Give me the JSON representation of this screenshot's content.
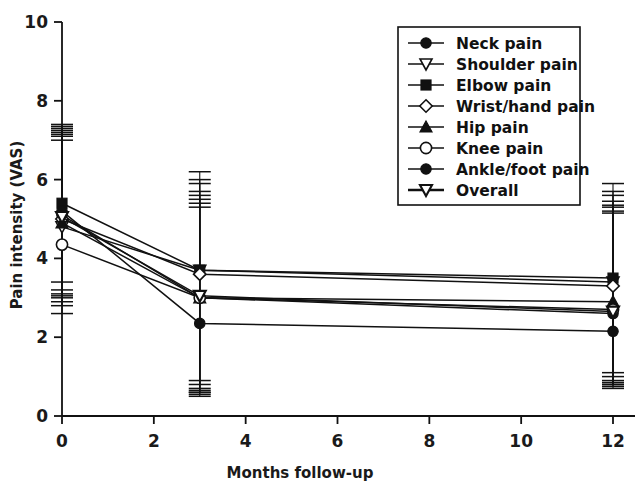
{
  "chart_data": {
    "type": "line",
    "title": "",
    "xlabel": "Months follow-up",
    "ylabel": "Pain intensity (VAS)",
    "xlim": [
      0,
      12
    ],
    "ylim": [
      0,
      10
    ],
    "xticks": [
      0,
      2,
      4,
      6,
      8,
      10,
      12
    ],
    "yticks": [
      0,
      2,
      4,
      6,
      8,
      10
    ],
    "xtick_labels": [
      "0",
      "2",
      "4",
      "6",
      "8",
      "10",
      "12"
    ],
    "ytick_labels": [
      "0",
      "2",
      "4",
      "6",
      "8",
      "10"
    ],
    "grid": false,
    "legend_position": "top-right",
    "x": [
      0,
      3,
      12
    ],
    "error_bar_note": "vertical whisker caps shown at x = 0, 3 and 12 for every series",
    "series": [
      {
        "name": "Neck pain",
        "marker": "filled-circle",
        "values": [
          5.1,
          3.0,
          2.6
        ],
        "err_low": [
          3.1,
          0.7,
          0.9
        ],
        "err_high": [
          7.2,
          5.4,
          5.2
        ]
      },
      {
        "name": "Shoulder pain",
        "marker": "open-triangle-down",
        "values": [
          4.8,
          3.7,
          3.4
        ],
        "err_low": [
          2.9,
          0.6,
          0.8
        ],
        "err_high": [
          7.1,
          5.9,
          5.6
        ]
      },
      {
        "name": "Elbow pain",
        "marker": "filled-square",
        "values": [
          5.4,
          3.7,
          3.5
        ],
        "err_low": [
          3.4,
          0.9,
          1.1
        ],
        "err_high": [
          7.4,
          6.2,
          5.9
        ]
      },
      {
        "name": "Wrist/hand pain",
        "marker": "open-diamond",
        "values": [
          5.0,
          3.6,
          3.3
        ],
        "err_low": [
          3.0,
          0.8,
          1.0
        ],
        "err_high": [
          7.3,
          6.0,
          5.7
        ]
      },
      {
        "name": "Hip pain",
        "marker": "filled-triangle-up",
        "values": [
          4.9,
          3.0,
          2.9
        ],
        "err_low": [
          2.8,
          0.6,
          0.8
        ],
        "err_high": [
          7.25,
          5.7,
          5.45
        ]
      },
      {
        "name": "Knee pain",
        "marker": "open-circle",
        "values": [
          4.35,
          3.0,
          2.7
        ],
        "err_low": [
          2.6,
          0.5,
          0.7
        ],
        "err_high": [
          7.0,
          5.5,
          5.3
        ]
      },
      {
        "name": "Ankle/foot pain",
        "marker": "filled-circle",
        "values": [
          5.2,
          2.35,
          2.15
        ],
        "err_low": [
          3.2,
          0.55,
          0.75
        ],
        "err_high": [
          7.35,
          5.6,
          5.35
        ]
      },
      {
        "name": "Overall",
        "marker": "open-triangle-down-bold",
        "values": [
          5.05,
          3.05,
          2.65
        ],
        "err_low": [
          3.05,
          0.65,
          0.85
        ],
        "err_high": [
          7.15,
          5.3,
          5.15
        ]
      }
    ]
  },
  "axes": {
    "x_title": "Months follow-up",
    "y_title": "Pain intensity (VAS)"
  },
  "legend": {
    "items": [
      {
        "label": "Neck pain"
      },
      {
        "label": "Shoulder pain"
      },
      {
        "label": "Elbow pain"
      },
      {
        "label": "Wrist/hand pain"
      },
      {
        "label": "Hip pain"
      },
      {
        "label": "Knee pain"
      },
      {
        "label": "Ankle/foot pain"
      },
      {
        "label": "Overall"
      }
    ]
  },
  "colors": {
    "ink": "#111111",
    "background": "#ffffff"
  }
}
